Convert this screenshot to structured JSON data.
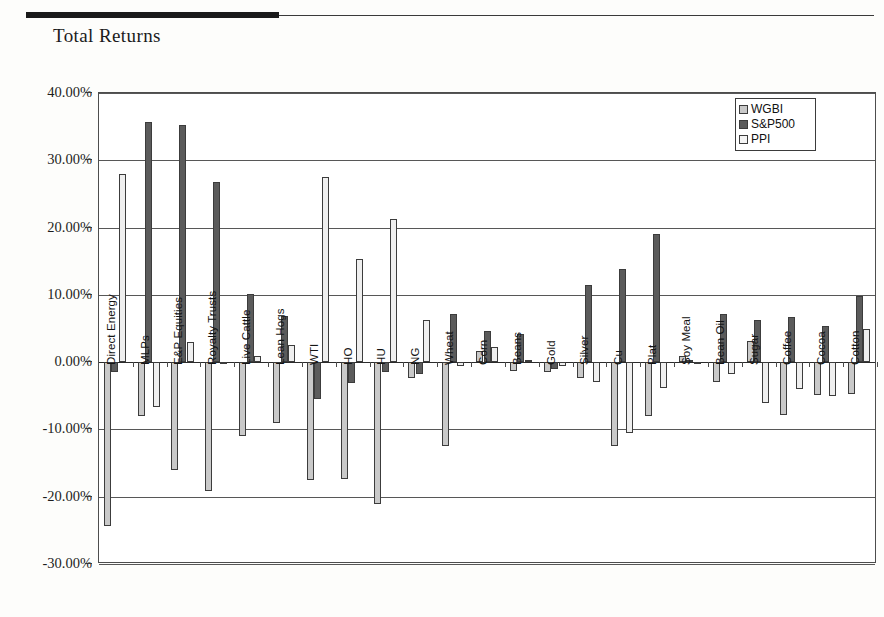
{
  "document": {
    "title": "Total Returns"
  },
  "legend": {
    "position": "top-right",
    "entries": [
      {
        "label": "WGBI",
        "color": "#c9c9c9"
      },
      {
        "label": "S&P500",
        "color": "#5b5b5b"
      },
      {
        "label": "PPI",
        "color": "#f4f4f4"
      }
    ]
  },
  "chart_data": {
    "type": "bar",
    "title": "Total Returns",
    "xlabel": "",
    "ylabel": "",
    "ylim": [
      -30,
      40
    ],
    "ytick_labels": [
      "40.00%",
      "30.00%",
      "20.00%",
      "10.00%",
      "0.00%",
      "-10.00%",
      "-20.00%",
      "-30.00%"
    ],
    "yticks": [
      40,
      30,
      20,
      10,
      0,
      -10,
      -20,
      -30
    ],
    "grid": true,
    "value_unit": "percent",
    "categories": [
      "Direct Energy",
      "MLPs",
      "E&P Equities",
      "Royalty Trusts",
      "Live Cattle",
      "Lean Hogs",
      "WTI",
      "HO",
      "HU",
      "NG",
      "Wheat",
      "Corn",
      "Beans",
      "Gold",
      "Silver",
      "Cu",
      "Plat",
      "Soy Meal",
      "Bean Oil",
      "Sugar",
      "Coffee",
      "Cocoa",
      "Cotton"
    ],
    "series": [
      {
        "name": "WGBI",
        "color": "#c9c9c9",
        "values": [
          -24.4,
          -8.0,
          -16.1,
          -19.1,
          -11.0,
          -9.0,
          -17.5,
          -17.3,
          -21.1,
          -2.3,
          -12.4,
          1.7,
          -1.3,
          -1.4,
          -2.3,
          -12.4,
          -8.0,
          0.9,
          -3.0,
          3.2,
          -7.8,
          -4.9,
          -4.8
        ]
      },
      {
        "name": "S&P500",
        "color": "#5b5b5b",
        "values": [
          -1.5,
          35.7,
          35.2,
          26.8,
          10.1,
          6.8,
          -5.5,
          -3.1,
          -1.5,
          -1.8,
          7.2,
          4.7,
          4.2,
          -1.0,
          11.4,
          13.8,
          19.0,
          0.3,
          7.1,
          6.2,
          6.7,
          5.4,
          9.9
        ]
      },
      {
        "name": "PPI",
        "color": "#f4f4f4",
        "values": [
          28.0,
          -6.7,
          3.0,
          -0.3,
          0.9,
          2.5,
          27.5,
          15.4,
          21.2,
          6.3,
          -0.6,
          2.3,
          0.3,
          -0.6,
          -3.0,
          -10.5,
          -3.8,
          -0.3,
          -1.8,
          -6.0,
          -4.0,
          -5.0,
          5.0
        ]
      }
    ]
  }
}
